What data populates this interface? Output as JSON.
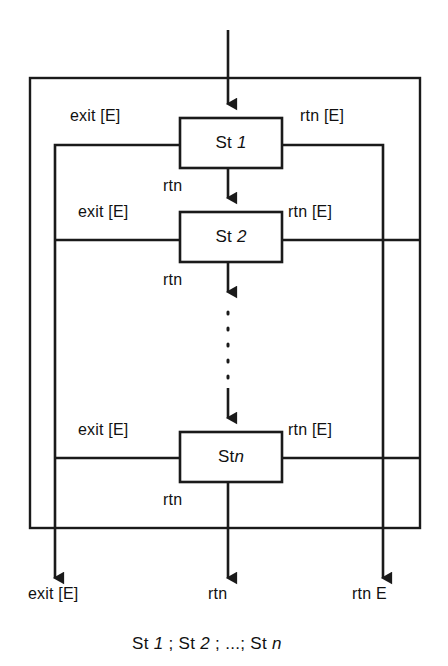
{
  "figure": {
    "type": "sequential-composition-statechart",
    "caption": "St 1 ; St 2 ; ...; St n",
    "caption_parts": {
      "p1": "St",
      "p1_italic": "1",
      "sep1": ";",
      "p2": "St",
      "p2_italic": "2",
      "sep2": ";",
      "ellipsis": "...;",
      "p3": "St",
      "p3_italic": "n"
    },
    "stroke_color": "#1a1a1a",
    "background_color": "#ffffff"
  },
  "states": [
    {
      "id": "st1",
      "label_prefix": "St",
      "label_index": "1",
      "left_label": "exit [E]",
      "right_label": "rtn [E]",
      "below_label": "rtn"
    },
    {
      "id": "st2",
      "label_prefix": "St",
      "label_index": "2",
      "left_label": "exit [E]",
      "right_label": "rtn [E]",
      "below_label": "rtn"
    },
    {
      "id": "stn",
      "label_prefix": "St",
      "label_index": "n",
      "left_label": "exit [E]",
      "right_label": "rtn [E]",
      "below_label": "rtn"
    }
  ],
  "outputs": [
    {
      "id": "exit-out",
      "label": "exit [E]"
    },
    {
      "id": "rtn-out",
      "label": "rtn"
    },
    {
      "id": "rtn-e-out",
      "label": "rtn E"
    }
  ]
}
